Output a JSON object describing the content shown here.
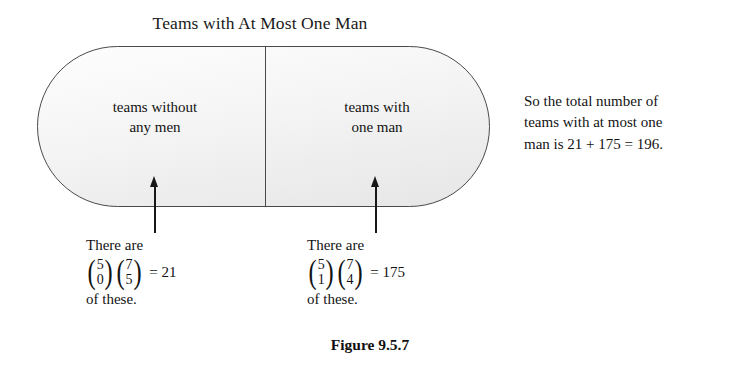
{
  "figure": {
    "title": "Teams with At Most One Man",
    "caption": "Figure 9.5.7",
    "regions": {
      "left": {
        "label_line1": "teams without",
        "label_line2": "any men"
      },
      "right": {
        "label_line1": "teams with",
        "label_line2": "one man"
      }
    },
    "annotations": {
      "left": {
        "lead": "There are",
        "binom1_top": "5",
        "binom1_bottom": "0",
        "binom2_top": "7",
        "binom2_bottom": "5",
        "equals": "= 21",
        "trail": "of these.",
        "paren_open": "(",
        "paren_close": ")"
      },
      "right": {
        "lead": "There are",
        "binom1_top": "5",
        "binom1_bottom": "1",
        "binom2_top": "7",
        "binom2_bottom": "4",
        "equals": "= 175",
        "trail": "of these.",
        "paren_open": "(",
        "paren_close": ")"
      }
    },
    "side_note": {
      "line1": "So the total number of",
      "line2": "teams with at most one",
      "line3": "man is 21 + 175 = 196."
    },
    "colors": {
      "outline": "#4a4a4a",
      "fill_top": "#fdfdfd",
      "fill_bottom": "#e6e6e6",
      "text": "#131313",
      "arrow": "#171717"
    }
  }
}
